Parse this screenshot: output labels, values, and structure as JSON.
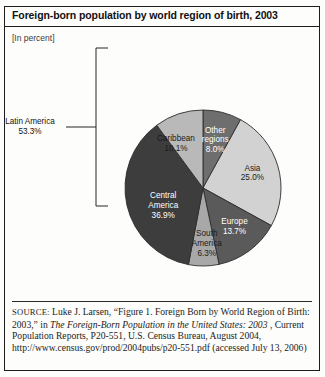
{
  "figure": {
    "title": "Foreign-born population by world region of birth, 2003",
    "subtitle": "[In percent]"
  },
  "source": {
    "label": "SOURCE:",
    "part1": " Luke J. Larsen, “Figure 1. Foreign Born by World Region of Birth: 2003,” in ",
    "italic1": "The Foreign-Born Population in the United States: 2003",
    "part2": ", Current Population Reports, P20-551, U.S. Census Bureau, August 2004, http://www.census.gov/prod/2004pubs/p20-551.pdf (accessed July 13, 2006)"
  },
  "colors": {
    "other_regions": "#6e6e6e",
    "asia": "#d2d2d2",
    "europe": "#5a5a5a",
    "south_america": "#a8a8a8",
    "central_america": "#3d3d3d",
    "caribbean": "#b9b9b9",
    "outline": "#2b2b2b",
    "leader": "#262626"
  },
  "chart_data": {
    "type": "pie",
    "title": "Foreign-born population by world region of birth, 2003",
    "subtitle": "[In percent]",
    "unit": "percent",
    "start_angle": 0,
    "direction": "clockwise",
    "grid": false,
    "legend": "none",
    "labels_position": "inside-slices",
    "categories": [
      "Other regions",
      "Asia",
      "Europe",
      "South America",
      "Central America",
      "Caribbean"
    ],
    "values": [
      8.0,
      25.0,
      13.7,
      6.3,
      36.9,
      10.1
    ],
    "slices": [
      {
        "name": "Other regions",
        "value": 8.0,
        "value_label": "8.0%",
        "label_lines": [
          "Other",
          "regions",
          "8.0%"
        ],
        "color": "#6e6e6e",
        "text_on": "dark",
        "label_r": 0.63,
        "label_mid_deg": 14.4
      },
      {
        "name": "Asia",
        "value": 25.0,
        "value_label": "25.0%",
        "label_lines": [
          "Asia",
          "25.0%"
        ],
        "color": "#d2d2d2",
        "text_on": "light",
        "label_r": 0.66,
        "label_mid_deg": 73.8
      },
      {
        "name": "Europe",
        "value": 13.7,
        "value_label": "13.7%",
        "label_lines": [
          "Europe",
          "13.7%"
        ],
        "color": "#5a5a5a",
        "text_on": "dark",
        "label_r": 0.64,
        "label_mid_deg": 140.9
      },
      {
        "name": "South America",
        "value": 6.3,
        "value_label": "6.3%",
        "label_lines": [
          "South",
          "America",
          "6.3%"
        ],
        "color": "#a8a8a8",
        "text_on": "light",
        "label_r": 0.72,
        "label_mid_deg": 176.1
      },
      {
        "name": "Central America",
        "value": 36.9,
        "value_label": "36.9%",
        "label_lines": [
          "Central",
          "America",
          "36.9%"
        ],
        "color": "#3d3d3d",
        "text_on": "dark",
        "label_r": 0.56,
        "label_mid_deg": 245.7
      },
      {
        "name": "Caribbean",
        "value": 10.1,
        "value_label": "10.1%",
        "label_lines": [
          "Caribbean",
          "10.1%"
        ],
        "color": "#b9b9b9",
        "text_on": "light",
        "label_r": 0.66,
        "label_mid_deg": 328.4
      }
    ],
    "annotations": [
      {
        "name": "latin-america-bracket",
        "label_lines": [
          "Latin America",
          "53.3%"
        ],
        "value": 53.3,
        "value_label": "53.3%",
        "groups": [
          "Caribbean",
          "Central America",
          "South America"
        ]
      }
    ]
  }
}
